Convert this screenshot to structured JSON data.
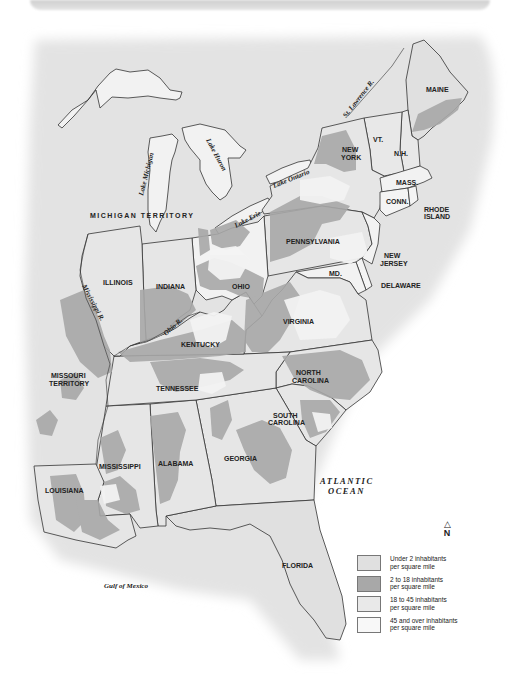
{
  "map": {
    "colors": {
      "land_base": "#e2e2e2",
      "water": "#ebebeb",
      "lake": "#efefef",
      "under_2": "#e0e0e0",
      "2_to_18": "#a8a8a8",
      "18_to_45": "#e6e6e6",
      "45_plus": "#f7f7f7",
      "border": "#333333"
    },
    "states": [
      {
        "name": "MAINE"
      },
      {
        "name": "N.H."
      },
      {
        "name": "VT."
      },
      {
        "name": "NEW YORK"
      },
      {
        "name": "MASS."
      },
      {
        "name": "CONN."
      },
      {
        "name": "RHODE ISLAND"
      },
      {
        "name": "PENNSYLVANIA"
      },
      {
        "name": "NEW JERSEY"
      },
      {
        "name": "DELAWARE"
      },
      {
        "name": "MD."
      },
      {
        "name": "VIRGINIA"
      },
      {
        "name": "NORTH CAROLINA"
      },
      {
        "name": "SOUTH CAROLINA"
      },
      {
        "name": "GEORGIA"
      },
      {
        "name": "FLORIDA"
      },
      {
        "name": "ALABAMA"
      },
      {
        "name": "MISSISSIPPI"
      },
      {
        "name": "LOUISIANA"
      },
      {
        "name": "TENNESSEE"
      },
      {
        "name": "KENTUCKY"
      },
      {
        "name": "OHIO"
      },
      {
        "name": "INDIANA"
      },
      {
        "name": "ILLINOIS"
      }
    ],
    "territories": {
      "michigan": "MICHIGAN TERRITORY",
      "missouri_line1": "MISSOURI",
      "missouri_line2": "TERRITORY"
    },
    "state_labels": {
      "maine": "MAINE",
      "nh": "N.H.",
      "vt": "VT.",
      "ny_line1": "NEW",
      "ny_line2": "YORK",
      "mass": "MASS.",
      "conn": "CONN.",
      "ri_line1": "RHODE",
      "ri_line2": "ISLAND",
      "pennsylvania": "PENNSYLVANIA",
      "nj_line1": "NEW",
      "nj_line2": "JERSEY",
      "delaware": "DELAWARE",
      "md": "MD.",
      "virginia": "VIRGINIA",
      "nc_line1": "NORTH",
      "nc_line2": "CAROLINA",
      "sc_line1": "SOUTH",
      "sc_line2": "CAROLINA",
      "georgia": "GEORGIA",
      "florida": "FLORIDA",
      "alabama": "ALABAMA",
      "mississippi": "MISSISSIPPI",
      "louisiana": "LOUISIANA",
      "tennessee": "TENNESSEE",
      "kentucky": "KENTUCKY",
      "ohio": "OHIO",
      "indiana": "INDIANA",
      "illinois": "ILLINOIS"
    },
    "water_labels": {
      "st_lawrence": "St. Lawrence R.",
      "lake_ontario": "Lake Ontario",
      "lake_erie": "Lake Erie",
      "lake_huron": "Lake Huron",
      "lake_michigan": "Lake Michigan",
      "mississippi_r": "Mississippi R.",
      "ohio_r": "Ohio R.",
      "atlantic_line1": "ATLANTIC",
      "atlantic_line2": "OCEAN",
      "gulf": "Gulf of Mexico"
    },
    "compass": {
      "arrow": "△",
      "label": "N"
    },
    "legend": {
      "items": [
        {
          "line1": "Under 2 inhabitants",
          "line2": "per square mile",
          "color": "#e0e0e0"
        },
        {
          "line1": "2 to 18 inhabitants",
          "line2": "per square mile",
          "color": "#a8a8a8"
        },
        {
          "line1": "18 to 45 inhabitants",
          "line2": "per square mile",
          "color": "#e9e9e9"
        },
        {
          "line1": "45 and over inhabitants",
          "line2": "per square mile",
          "color": "#f8f8f8"
        }
      ]
    }
  }
}
